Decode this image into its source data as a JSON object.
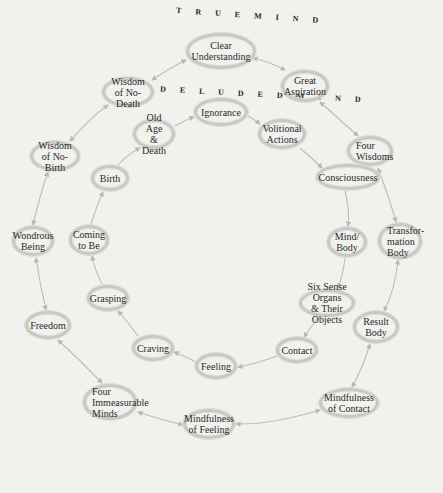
{
  "diagram": {
    "headings": {
      "true_mind": "T R U E   M I N D",
      "deluded_mind": "D E L U D E D   M I N D"
    },
    "colors": {
      "background": "#f1f1ee",
      "ellipse_border": "#c9c9c4",
      "arrow": "#b9b9b4",
      "text": "#2a2a2a"
    },
    "outer_ring": [
      {
        "id": "clear-understanding",
        "label": "Clear\nUnderstanding",
        "x": 221,
        "y": 51,
        "w": 70,
        "h": 36
      },
      {
        "id": "great-aspiration",
        "label": "Great\nAspiration",
        "x": 305,
        "y": 86,
        "w": 48,
        "h": 32
      },
      {
        "id": "four-wisdoms",
        "label": "Four\nWisdoms",
        "x": 370,
        "y": 151,
        "w": 46,
        "h": 30
      },
      {
        "id": "transformation-body",
        "label": "Transfor-\nmation\nBody",
        "x": 400,
        "y": 241,
        "w": 44,
        "h": 36
      },
      {
        "id": "result-body",
        "label": "Result\nBody",
        "x": 376,
        "y": 327,
        "w": 46,
        "h": 32
      },
      {
        "id": "mindfulness-of-contact",
        "label": "Mindfulness\nof Contact",
        "x": 349,
        "y": 403,
        "w": 60,
        "h": 30
      },
      {
        "id": "mindfulness-of-feeling",
        "label": "Mindfulness\nof Feeling",
        "x": 209,
        "y": 424,
        "w": 52,
        "h": 30
      },
      {
        "id": "four-immeasurable-minds",
        "label": "Four\nImmeasurable\nMinds",
        "x": 110,
        "y": 402,
        "w": 54,
        "h": 36
      },
      {
        "id": "freedom",
        "label": "Freedom",
        "x": 48,
        "y": 325,
        "w": 46,
        "h": 28
      },
      {
        "id": "wondrous-being",
        "label": "Wondrous\nBeing",
        "x": 33,
        "y": 241,
        "w": 42,
        "h": 30
      },
      {
        "id": "wisdom-of-no-birth",
        "label": "Wisdom\nof No-Birth",
        "x": 55,
        "y": 156,
        "w": 50,
        "h": 30
      },
      {
        "id": "wisdom-of-no-death",
        "label": "Wisdom\nof No-Death",
        "x": 128,
        "y": 92,
        "w": 52,
        "h": 30
      }
    ],
    "inner_ring": [
      {
        "id": "ignorance",
        "label": "Ignorance",
        "x": 221,
        "y": 112,
        "w": 54,
        "h": 28
      },
      {
        "id": "volitional-actions",
        "label": "Volitional\nActions",
        "x": 282,
        "y": 134,
        "w": 48,
        "h": 30
      },
      {
        "id": "consciousness",
        "label": "Consciousness",
        "x": 348,
        "y": 177,
        "w": 64,
        "h": 26
      },
      {
        "id": "mind-body",
        "label": "Mind/\nBody",
        "x": 347,
        "y": 242,
        "w": 40,
        "h": 30
      },
      {
        "id": "six-sense-organs",
        "label": "Six Sense Organs\n& Their Objects",
        "x": 327,
        "y": 303,
        "w": 56,
        "h": 28
      },
      {
        "id": "contact",
        "label": "Contact",
        "x": 297,
        "y": 350,
        "w": 42,
        "h": 26
      },
      {
        "id": "feeling",
        "label": "Feeling",
        "x": 216,
        "y": 366,
        "w": 42,
        "h": 26
      },
      {
        "id": "craving",
        "label": "Craving",
        "x": 153,
        "y": 348,
        "w": 42,
        "h": 26
      },
      {
        "id": "grasping",
        "label": "Grasping",
        "x": 108,
        "y": 298,
        "w": 42,
        "h": 26
      },
      {
        "id": "coming-to-be",
        "label": "Coming\nto Be",
        "x": 89,
        "y": 240,
        "w": 40,
        "h": 30
      },
      {
        "id": "birth",
        "label": "Birth",
        "x": 110,
        "y": 178,
        "w": 38,
        "h": 26
      },
      {
        "id": "old-age-death",
        "label": "Old Age\n& Death",
        "x": 154,
        "y": 134,
        "w": 42,
        "h": 30
      }
    ]
  }
}
